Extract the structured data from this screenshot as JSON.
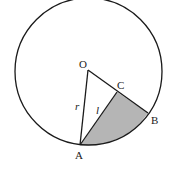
{
  "diagram": {
    "type": "geometry",
    "colors": {
      "stroke": "#1a1a1a",
      "shade": "#b5b5b5",
      "background": "#ffffff"
    },
    "points": {
      "O": {
        "label": "O",
        "x": 88,
        "y": 70
      },
      "A": {
        "label": "A",
        "x": 80,
        "y": 145
      },
      "B": {
        "label": "B",
        "x": 148,
        "y": 113
      },
      "C": {
        "label": "C",
        "x": 117,
        "y": 92
      }
    },
    "circle": {
      "cx": 88.5,
      "cy": 71.5,
      "r": 73.5
    },
    "segment_labels": {
      "r": "r",
      "l": "l"
    }
  }
}
